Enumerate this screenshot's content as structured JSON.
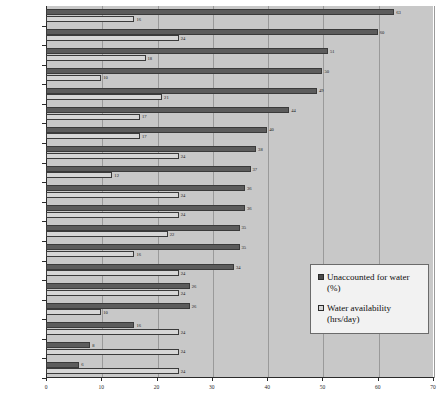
{
  "chart_data": {
    "type": "bar",
    "orientation": "horizontal",
    "title": "",
    "xlabel": "",
    "ylabel": "",
    "xlim": [
      0,
      70
    ],
    "xticks": [
      0,
      10,
      20,
      30,
      40,
      50,
      60,
      70
    ],
    "grid": true,
    "legend_position": "center-right",
    "categories": [
      "Hanoi",
      "Mandlay",
      "Jakarta",
      "Calcutta",
      "Ulaan Baatar",
      "Manila",
      "Lahore",
      "Bangkok",
      "Phnom Penh",
      "Kuala Lumpur",
      "Hong Kong",
      "Colombo",
      "Chittagong",
      "Seoul",
      "Taipei",
      "Delhi",
      "Tashkant",
      "Beijing",
      "Singapore"
    ],
    "series": [
      {
        "name": "Unaccounted for water (%)",
        "color": "#5c5c5c",
        "values": [
          63,
          60,
          51,
          50,
          49,
          44,
          40,
          38,
          37,
          36,
          36,
          35,
          35,
          34,
          26,
          26,
          16,
          8,
          6
        ]
      },
      {
        "name": "Water availability (hrs/day)",
        "color": "#d6d6d6",
        "values": [
          16,
          24,
          18,
          10,
          21,
          17,
          17,
          24,
          12,
          24,
          24,
          22,
          16,
          24,
          24,
          10,
          24,
          24,
          24
        ]
      }
    ]
  },
  "legend": {
    "entries": [
      {
        "label": "Unaccounted for water (%)"
      },
      {
        "label": "Water availability (hrs/day)"
      }
    ]
  }
}
